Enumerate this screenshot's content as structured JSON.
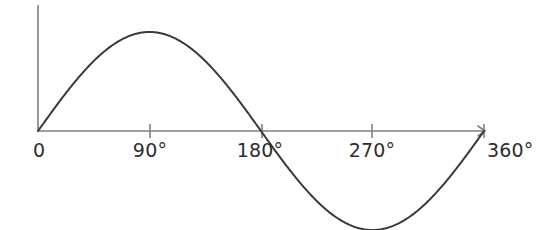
{
  "figure": {
    "kind": "sine-wave-plot",
    "background_color": "#ffffff",
    "width": 537,
    "height": 230
  },
  "axes": {
    "axis_color": "#808080",
    "axis_stroke_width": 1.6,
    "x_axis": {
      "name": "x-axis",
      "y_px": 131,
      "x_start_px": 38,
      "x_end_px": 485,
      "has_arrow_head": true
    },
    "y_axis": {
      "name": "y-axis",
      "x_px": 38,
      "y_top_px": 5,
      "y_bottom_px": 131,
      "has_arrow_head": false
    },
    "tick": {
      "above_px": 7,
      "below_px": 7,
      "color": "#808080",
      "stroke_width": 1.6
    }
  },
  "ticks": [
    {
      "label": "0",
      "degrees": 0,
      "x_px": 38,
      "draw_tick": false,
      "label_x_px": 33,
      "label_anchor": "start"
    },
    {
      "label": "90°",
      "degrees": 90,
      "x_px": 150,
      "draw_tick": true,
      "label_x_px": 150,
      "label_anchor": "middle"
    },
    {
      "label": "180°",
      "degrees": 180,
      "x_px": 262,
      "draw_tick": true,
      "label_x_px": 260,
      "label_anchor": "middle"
    },
    {
      "label": "270°",
      "degrees": 270,
      "x_px": 372,
      "draw_tick": true,
      "label_x_px": 372,
      "label_anchor": "middle"
    },
    {
      "label": "360°",
      "degrees": 360,
      "x_px": 484,
      "draw_tick": true,
      "label_x_px": 487,
      "label_anchor": "start"
    }
  ],
  "tick_label_style": {
    "color": "#2e2e2e",
    "font_size_px": 19,
    "baseline_top_px": 141
  },
  "curve": {
    "name": "sine-curve",
    "color": "#3a3a3a",
    "stroke_width": 2.0,
    "amplitude_px": 99,
    "baseline_y_px": 131,
    "x_start_px": 38,
    "x_end_px": 484,
    "peak": {
      "degrees": 90,
      "x_px": 150,
      "y_px": 32
    },
    "zero_crossings": [
      {
        "degrees": 0,
        "x_px": 38
      },
      {
        "degrees": 180,
        "x_px": 261
      },
      {
        "degrees": 360,
        "x_px": 484
      }
    ],
    "trough": {
      "degrees": 270,
      "x_px": 372,
      "y_px": 210
    }
  },
  "chart_data": {
    "type": "line",
    "title": "",
    "xlabel": "",
    "ylabel": "",
    "grid": false,
    "legend": null,
    "xlim": [
      0,
      360
    ],
    "ylim": [
      -1,
      1
    ],
    "xticks": [
      0,
      90,
      180,
      270,
      360
    ],
    "xticklabels": [
      "0",
      "90°",
      "180°",
      "270°",
      "360°"
    ],
    "yticks": [],
    "yticklabels": [],
    "series": [
      {
        "name": "sin(x)",
        "color": "#3a3a3a",
        "x": [
          0,
          10,
          20,
          30,
          40,
          50,
          60,
          70,
          80,
          90,
          100,
          110,
          120,
          130,
          140,
          150,
          160,
          170,
          180,
          190,
          200,
          210,
          220,
          230,
          240,
          250,
          260,
          270,
          280,
          290,
          300,
          310,
          320,
          330,
          340,
          350,
          360
        ],
        "y": [
          0,
          0.174,
          0.342,
          0.5,
          0.643,
          0.766,
          0.866,
          0.94,
          0.985,
          1.0,
          0.985,
          0.94,
          0.866,
          0.766,
          0.643,
          0.5,
          0.342,
          0.174,
          0.0,
          -0.174,
          -0.342,
          -0.5,
          -0.643,
          -0.766,
          -0.866,
          -0.94,
          -0.985,
          -1.0,
          -0.985,
          -0.94,
          -0.866,
          -0.766,
          -0.643,
          -0.5,
          -0.342,
          -0.174,
          0.0
        ]
      }
    ]
  }
}
